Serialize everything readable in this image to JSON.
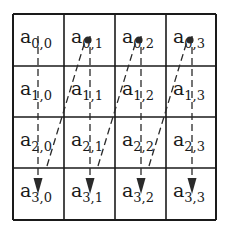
{
  "diagram": {
    "title": "",
    "rows": 4,
    "cols": 4,
    "base_symbol": "a",
    "grid": {
      "x_lines": [
        13,
        64,
        115,
        166,
        216
      ],
      "y_lines": [
        14,
        66,
        117,
        168,
        220
      ],
      "line_color": "#1a1a1a"
    },
    "cells": [
      [
        {
          "symbol": "a",
          "sub": "0,0"
        },
        {
          "symbol": "a",
          "sub": "0,1"
        },
        {
          "symbol": "a",
          "sub": "0,2"
        },
        {
          "symbol": "a",
          "sub": "0,3"
        }
      ],
      [
        {
          "symbol": "a",
          "sub": "1,0"
        },
        {
          "symbol": "a",
          "sub": "1,1"
        },
        {
          "symbol": "a",
          "sub": "1,2"
        },
        {
          "symbol": "a",
          "sub": "1,3"
        }
      ],
      [
        {
          "symbol": "a",
          "sub": "2,0"
        },
        {
          "symbol": "a",
          "sub": "2,1"
        },
        {
          "symbol": "a",
          "sub": "2,2"
        },
        {
          "symbol": "a",
          "sub": "2,3"
        }
      ],
      [
        {
          "symbol": "a",
          "sub": "3,0"
        },
        {
          "symbol": "a",
          "sub": "3,1"
        },
        {
          "symbol": "a",
          "sub": "3,2"
        },
        {
          "symbol": "a",
          "sub": "3,3"
        }
      ]
    ],
    "traversal": "column-major",
    "vertical_arrows": [
      {
        "col": 0,
        "x": 38,
        "y_start": 36,
        "y_end": 192
      },
      {
        "col": 1,
        "x": 90,
        "y_start": 36,
        "y_end": 192
      },
      {
        "col": 2,
        "x": 141,
        "y_start": 36,
        "y_end": 192
      },
      {
        "col": 3,
        "x": 192,
        "y_start": 36,
        "y_end": 192
      }
    ],
    "diagonal_links": [
      {
        "from_col": 0,
        "to_col": 1,
        "x1": 47,
        "y1": 166,
        "x2": 86,
        "y2": 38
      },
      {
        "from_col": 1,
        "to_col": 2,
        "x1": 98,
        "y1": 166,
        "x2": 137,
        "y2": 38
      },
      {
        "from_col": 2,
        "to_col": 3,
        "x1": 149,
        "y1": 166,
        "x2": 188,
        "y2": 38
      }
    ],
    "dots": [
      {
        "col": 1,
        "x": 88,
        "y": 40
      },
      {
        "col": 2,
        "x": 139,
        "y": 40
      },
      {
        "col": 3,
        "x": 190,
        "y": 40
      }
    ],
    "arrow_color": "#2a2a2a",
    "dash": "7,4"
  }
}
